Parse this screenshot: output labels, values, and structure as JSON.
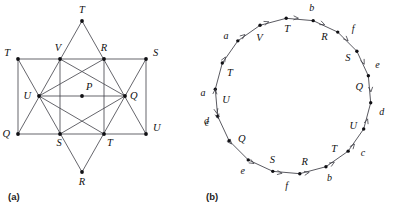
{
  "figure": {
    "panels": [
      {
        "caption": "(a)",
        "type": "star-graph",
        "description": "Hexagram star graph with labeled vertices",
        "vertices": [
          {
            "id": "t-top",
            "label": "T",
            "x": 82,
            "y": 21,
            "lx": 82,
            "ly": 13,
            "anchor": "middle"
          },
          {
            "id": "t-left",
            "label": "T",
            "x": 18,
            "y": 59,
            "lx": 10,
            "ly": 56,
            "anchor": "end"
          },
          {
            "id": "v",
            "label": "V",
            "x": 60,
            "y": 59,
            "lx": 58,
            "ly": 51,
            "anchor": "middle"
          },
          {
            "id": "r-upper",
            "label": "R",
            "x": 104,
            "y": 59,
            "lx": 104,
            "ly": 51,
            "anchor": "middle"
          },
          {
            "id": "s-right",
            "label": "S",
            "x": 146,
            "y": 59,
            "lx": 153,
            "ly": 56,
            "anchor": "start"
          },
          {
            "id": "u-left",
            "label": "U",
            "x": 39,
            "y": 96,
            "lx": 31,
            "ly": 99,
            "anchor": "end"
          },
          {
            "id": "p",
            "label": "P",
            "x": 82,
            "y": 96,
            "lx": 86,
            "ly": 90,
            "anchor": "start"
          },
          {
            "id": "q-right",
            "label": "Q",
            "x": 125,
            "y": 96,
            "lx": 130,
            "ly": 99,
            "anchor": "start"
          },
          {
            "id": "q-left",
            "label": "Q",
            "x": 18,
            "y": 134,
            "lx": 10,
            "ly": 137,
            "anchor": "end"
          },
          {
            "id": "s-bottom",
            "label": "S",
            "x": 60,
            "y": 134,
            "lx": 59,
            "ly": 146,
            "anchor": "middle"
          },
          {
            "id": "t-bottom",
            "label": "T",
            "x": 104,
            "y": 134,
            "lx": 107,
            "ly": 146,
            "anchor": "start"
          },
          {
            "id": "u-right",
            "label": "U",
            "x": 146,
            "y": 134,
            "lx": 153,
            "ly": 131,
            "anchor": "start"
          },
          {
            "id": "r-bottom",
            "label": "R",
            "x": 82,
            "y": 172,
            "lx": 82,
            "ly": 185,
            "anchor": "middle"
          }
        ],
        "edges": [
          {
            "from": "t-left",
            "to": "s-right"
          },
          {
            "from": "u-left",
            "to": "q-right"
          },
          {
            "from": "q-left",
            "to": "u-right"
          },
          {
            "from": "t-top",
            "to": "q-left"
          },
          {
            "from": "t-top",
            "to": "u-right"
          },
          {
            "from": "r-bottom",
            "to": "t-left"
          },
          {
            "from": "r-bottom",
            "to": "s-right"
          },
          {
            "from": "t-left",
            "to": "q-left"
          },
          {
            "from": "s-right",
            "to": "u-right"
          },
          {
            "from": "v",
            "to": "s-bottom"
          },
          {
            "from": "r-upper",
            "to": "t-bottom"
          },
          {
            "from": "u-left",
            "to": "r-upper"
          },
          {
            "from": "v",
            "to": "q-right"
          },
          {
            "from": "s-bottom",
            "to": "q-right"
          },
          {
            "from": "u-left",
            "to": "t-bottom"
          }
        ]
      },
      {
        "caption": "(b)",
        "type": "directed-cycle",
        "description": "Eulerian circuit drawn as an 18-vertex directed cycle",
        "center": {
          "x": 96,
          "y": 96
        },
        "radius": 78,
        "vertices": [
          {
            "index": 0,
            "label": "T",
            "angle": 160,
            "label_offset": 11
          },
          {
            "index": 1,
            "label": "V",
            "angle": 120,
            "label_offset": 11
          },
          {
            "index": 2,
            "label": "T",
            "angle": 95,
            "label_offset": 11
          },
          {
            "index": 3,
            "label": "R",
            "angle": 62,
            "label_offset": 11
          },
          {
            "index": 4,
            "label": "S",
            "angle": 35,
            "label_offset": 11
          },
          {
            "index": 5,
            "label": "Q",
            "angle": 8,
            "label_offset": 11
          },
          {
            "index": 6,
            "label": "U",
            "angle": -26,
            "label_offset": 11
          },
          {
            "index": 7,
            "label": "T",
            "angle": -52,
            "label_offset": 11
          },
          {
            "index": 8,
            "label": "R",
            "angle": -80,
            "label_offset": 11
          },
          {
            "index": 9,
            "label": "S",
            "angle": -108,
            "label_offset": 11
          },
          {
            "index": 10,
            "label": "Q",
            "angle": -140,
            "label_offset": 11
          },
          {
            "index": 11,
            "label": "U",
            "angle": 183,
            "label_offset": 11
          }
        ],
        "edge_labels": [
          {
            "label": "a",
            "angle": 178,
            "offset": 12
          },
          {
            "label": "a",
            "angle": 138,
            "offset": 12
          },
          {
            "label": "b",
            "angle": 78,
            "offset": 12
          },
          {
            "label": "f",
            "angle": 48,
            "offset": 12
          },
          {
            "label": "e",
            "angle": 20,
            "offset": 12
          },
          {
            "label": "d",
            "angle": -10,
            "offset": 12
          },
          {
            "label": "c",
            "angle": -39,
            "offset": 12
          },
          {
            "label": "b",
            "angle": -66,
            "offset": 12
          },
          {
            "label": "f",
            "angle": -94,
            "offset": 12
          },
          {
            "label": "e",
            "angle": -124,
            "offset": 12
          },
          {
            "label": "d",
            "angle": -164,
            "offset": 12
          },
          {
            "label": "c",
            "angle": 197,
            "offset": 12
          }
        ],
        "arrow_directions": "counterclockwise on upper arc, clockwise on lower arc, meeting at U vertices",
        "label_sequence": [
          "a",
          "a",
          "b",
          "f",
          "e",
          "d",
          "c",
          "b",
          "f",
          "e",
          "d",
          "c"
        ],
        "vertex_sequence": [
          "T",
          "V",
          "T",
          "R",
          "S",
          "Q",
          "U",
          "T",
          "R",
          "S",
          "Q",
          "U"
        ]
      }
    ]
  },
  "colors": {
    "line": "#4a4a52",
    "dot": "#101014",
    "text": "#1a1a1a",
    "background": "#ffffff"
  }
}
